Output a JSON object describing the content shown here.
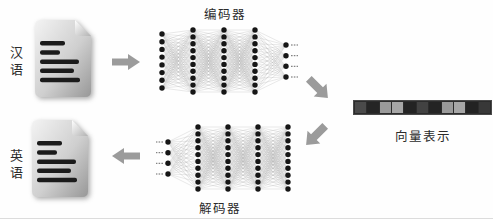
{
  "diagram": {
    "source_label": "汉语",
    "target_label": "英语",
    "encoder_label": "编码器",
    "decoder_label": "解码器",
    "vector_label": "向量表示"
  },
  "networks": {
    "encoder": {
      "layers": [
        8,
        10,
        10,
        10,
        4
      ],
      "dashes": "right"
    },
    "decoder": {
      "layers": [
        4,
        10,
        10,
        10,
        10
      ],
      "dashes": "left"
    }
  },
  "vector_bar": {
    "cells": [
      "#4a4a4a",
      "#252525",
      "#9a9a9a",
      "#a6a6a6",
      "#232323",
      "#424242",
      "#242424",
      "#9a9a9a",
      "#a6a6a6",
      "#232323",
      "#383838"
    ]
  },
  "document_lines": {
    "widths": [
      25,
      20,
      39,
      34,
      40
    ]
  },
  "colors": {
    "arrow": "#9b9b9b",
    "node": "#161616",
    "edge": "#b5b5b5",
    "doc_line": "#1b1b1b",
    "dash": "#666666"
  }
}
